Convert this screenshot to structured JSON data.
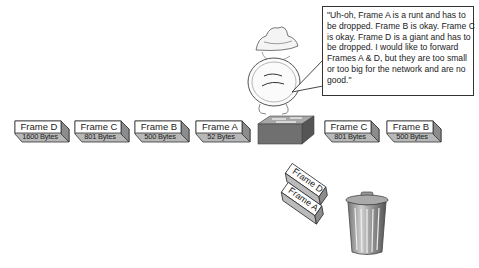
{
  "diagram": {
    "incoming_frames": [
      {
        "name": "Frame D",
        "size": "1600 Bytes"
      },
      {
        "name": "Frame C",
        "size": "801 Bytes"
      },
      {
        "name": "Frame B",
        "size": "500 Bytes"
      },
      {
        "name": "Frame A",
        "size": "52 Bytes"
      }
    ],
    "forwarded_frames": [
      {
        "name": "Frame C",
        "size": "801 Bytes"
      },
      {
        "name": "Frame B",
        "size": "500 Bytes"
      }
    ],
    "dropped_frames": [
      {
        "name": "Frame D"
      },
      {
        "name": "Frame A"
      }
    ],
    "speech_bubble": "\"Uh-oh, Frame A is a runt and has to be dropped. Frame B is okay. Frame C is okay. Frame D is a giant and has to be dropped. I would like to forward Frames A & D, but they are too small or too big for the network and are no good.\"",
    "icons": [
      "switch-icon",
      "inspector-character-icon",
      "trash-can-icon"
    ],
    "colors": {
      "frame_face": "#ffffff",
      "frame_side": "#b0b0b0",
      "switch_top": "#9a9a9a",
      "switch_side": "#6e6e6e",
      "outline": "#333333"
    }
  }
}
